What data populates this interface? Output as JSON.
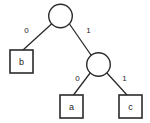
{
  "figure": {
    "name": "binary-code-tree",
    "background_color": "#ffffff",
    "stroke_color": "#2b2b2b",
    "text_color": "#1c1c1c",
    "width": 150,
    "height": 123
  },
  "chart_data": {
    "type": "diagram",
    "diagram_kind": "binary-tree",
    "title": "",
    "nodes": [
      {
        "id": "root",
        "kind": "circle",
        "label": "",
        "cx": 60.5,
        "cy": 16.0,
        "r": 11.8
      },
      {
        "id": "internal1",
        "kind": "circle",
        "label": "",
        "cx": 98.5,
        "cy": 64.5,
        "r": 11.8
      },
      {
        "id": "leaf_b",
        "kind": "box",
        "label": "b",
        "x": 10.0,
        "y": 50.0,
        "w": 23.0,
        "h": 23.0
      },
      {
        "id": "leaf_a",
        "kind": "box",
        "label": "a",
        "x": 60.0,
        "y": 95.0,
        "w": 23.0,
        "h": 23.0
      },
      {
        "id": "leaf_c",
        "kind": "box",
        "label": "c",
        "x": 119.0,
        "y": 95.0,
        "w": 23.0,
        "h": 23.0
      }
    ],
    "edges": [
      {
        "id": "edge-root-b",
        "from": "root",
        "to": "leaf_b",
        "label": "0",
        "x1": 51.5,
        "y1": 24.0,
        "x2": 23.0,
        "y2": 50.0,
        "label_x": 26.5,
        "label_y": 30.5
      },
      {
        "id": "edge-root-internal1",
        "from": "root",
        "to": "internal1",
        "label": "1",
        "x1": 69.5,
        "y1": 24.0,
        "x2": 92.0,
        "y2": 56.5,
        "label_x": 88.5,
        "label_y": 30.5
      },
      {
        "id": "edge-internal1-a",
        "from": "internal1",
        "to": "leaf_a",
        "label": "0",
        "x1": 90.5,
        "y1": 72.5,
        "x2": 73.5,
        "y2": 95.0,
        "label_x": 77.5,
        "label_y": 78.5
      },
      {
        "id": "edge-internal1-c",
        "from": "internal1",
        "to": "leaf_c",
        "label": "1",
        "x1": 106.5,
        "y1": 72.5,
        "x2": 127.0,
        "y2": 95.0,
        "label_x": 124.5,
        "label_y": 78.5
      }
    ],
    "leaf_labels": [
      "b",
      "a",
      "c"
    ],
    "edge_labels": [
      "0",
      "1",
      "0",
      "1"
    ],
    "codes": [
      {
        "symbol": "b",
        "code": "0"
      },
      {
        "symbol": "a",
        "code": "10"
      },
      {
        "symbol": "c",
        "code": "11"
      }
    ]
  }
}
